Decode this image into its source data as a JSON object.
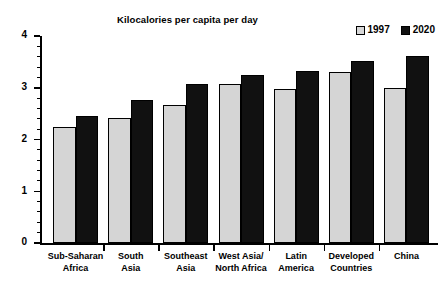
{
  "chart_data": {
    "type": "bar",
    "title": "Kilocalories per capita per day",
    "xlabel": "",
    "ylabel": "",
    "ylim": [
      0,
      4
    ],
    "yticks": [
      0,
      1,
      2,
      3,
      4
    ],
    "ytick_labels": [
      "0",
      "1",
      "2",
      "3",
      "4"
    ],
    "minor_tick_interval": 0.2,
    "grid": false,
    "legend_position": "top-right",
    "categories": [
      "Sub-Saharan\nAfrica",
      "South\nAsia",
      "Southeast\nAsia",
      "West Asia/\nNorth Africa",
      "Latin\nAmerica",
      "Developed\nCountries",
      "China"
    ],
    "series": [
      {
        "name": "1997",
        "color": "#d5d5d5",
        "values": [
          2.25,
          2.42,
          2.67,
          3.08,
          2.98,
          3.3,
          3.0
        ]
      },
      {
        "name": "2020",
        "color": "#111111",
        "values": [
          2.45,
          2.77,
          3.07,
          3.25,
          3.33,
          3.52,
          3.62
        ]
      }
    ]
  },
  "legend": {
    "entries": [
      {
        "label": "1997",
        "swatch": "light-gray"
      },
      {
        "label": "2020",
        "swatch": "black"
      }
    ]
  }
}
